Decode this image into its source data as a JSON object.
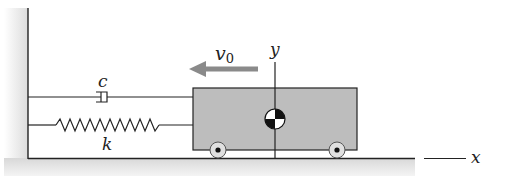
{
  "labels": {
    "damper": "c",
    "spring": "k",
    "velocity": "v",
    "velocity_subscript": "0",
    "x_axis": "x",
    "y_axis": "y"
  },
  "colors": {
    "cart_fill": "#bdbdbd",
    "arrow": "#8a8a8a",
    "ground_shade": "#e6e6e6",
    "line": "#222222"
  }
}
